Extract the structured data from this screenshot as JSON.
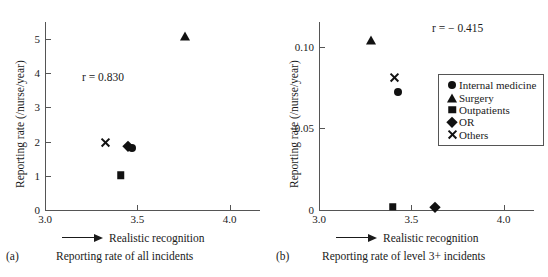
{
  "figure": {
    "series_names": [
      "Internal medicine",
      "Surgery",
      "Outpatients",
      "OR",
      "Others"
    ],
    "marker_color": "#111111",
    "axis_color": "#555555"
  },
  "legend": {
    "items": [
      {
        "label": "Internal medicine",
        "marker": "circle-icon"
      },
      {
        "label": "Surgery",
        "marker": "triangle-icon"
      },
      {
        "label": "Outpatients",
        "marker": "square-icon"
      },
      {
        "label": "OR",
        "marker": "diamond-icon"
      },
      {
        "label": "Others",
        "marker": "x-icon"
      }
    ]
  },
  "panel_a": {
    "tag": "(a)",
    "caption": "Reporting rate of all incidents",
    "arrow_label": "Realistic recognition",
    "ylabel": "Reporting rate (/nurse/year)",
    "annotation": "r = 0.830",
    "xticks": [
      "3.0",
      "3.5",
      "4.0"
    ],
    "yticks": [
      "0",
      "1",
      "2",
      "3",
      "4",
      "5"
    ]
  },
  "panel_b": {
    "tag": "(b)",
    "caption": "Reporting rate of level 3+ incidents",
    "arrow_label": "Realistic recognition",
    "ylabel": "Reporting rate (/nurse/year)",
    "annotation": "r = − 0.415",
    "xticks": [
      "3.0",
      "3.5",
      "4.0"
    ],
    "yticks": [
      "0",
      "0.05",
      "0.10"
    ]
  },
  "chart_data": [
    {
      "type": "scatter",
      "panel": "(a)",
      "title": "Reporting rate of all incidents",
      "xlabel": "Realistic recognition",
      "ylabel": "Reporting rate (/nurse/year)",
      "xlim": [
        3.0,
        4.1
      ],
      "ylim": [
        0,
        5.5
      ],
      "xticks": [
        3.0,
        3.5,
        4.0
      ],
      "yticks": [
        0,
        1,
        2,
        3,
        4,
        5
      ],
      "grid": false,
      "legend": false,
      "annotation": "r = 0.830",
      "correlation": 0.83,
      "points": [
        {
          "name": "Others",
          "marker": "x",
          "x": 3.33,
          "y": 1.97
        },
        {
          "name": "OR",
          "marker": "diamond",
          "x": 3.45,
          "y": 1.88
        },
        {
          "name": "Internal medicine",
          "marker": "circle",
          "x": 3.47,
          "y": 1.82
        },
        {
          "name": "Outpatients",
          "marker": "square",
          "x": 3.41,
          "y": 1.01
        },
        {
          "name": "Surgery",
          "marker": "triangle",
          "x": 3.76,
          "y": 5.1
        }
      ]
    },
    {
      "type": "scatter",
      "panel": "(b)",
      "title": "Reporting rate of level 3+ incidents",
      "xlabel": "Realistic recognition",
      "ylabel": "Reporting rate (/nurse/year)",
      "xlim": [
        3.0,
        4.1
      ],
      "ylim": [
        0,
        0.115
      ],
      "xticks": [
        3.0,
        3.5,
        4.0
      ],
      "yticks": [
        0,
        0.05,
        0.1
      ],
      "grid": false,
      "legend": true,
      "legend_position": "right",
      "annotation": "r = − 0.415",
      "correlation": -0.415,
      "points": [
        {
          "name": "Surgery",
          "marker": "triangle",
          "x": 3.28,
          "y": 0.104
        },
        {
          "name": "Others",
          "marker": "x",
          "x": 3.41,
          "y": 0.081
        },
        {
          "name": "Internal medicine",
          "marker": "circle",
          "x": 3.43,
          "y": 0.072
        },
        {
          "name": "Outpatients",
          "marker": "square",
          "x": 3.4,
          "y": 0.002
        },
        {
          "name": "OR",
          "marker": "diamond",
          "x": 3.63,
          "y": 0.002
        }
      ]
    }
  ]
}
